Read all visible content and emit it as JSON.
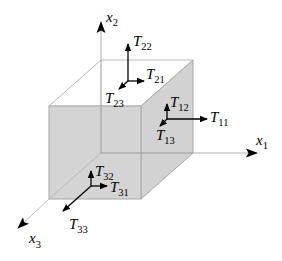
{
  "figure": {
    "colors": {
      "face_fill": "#d4d4d4",
      "edge": "#a8a8a8",
      "axis": "#b0b0b0",
      "arrow": "#000000"
    }
  },
  "axes": [
    {
      "id": "x1",
      "base": "x",
      "sub": "1"
    },
    {
      "id": "x2",
      "base": "x",
      "sub": "2"
    },
    {
      "id": "x3",
      "base": "x",
      "sub": "3"
    }
  ],
  "stress_labels": [
    {
      "id": "T11",
      "base": "T",
      "sub": "11"
    },
    {
      "id": "T12",
      "base": "T",
      "sub": "12"
    },
    {
      "id": "T13",
      "base": "T",
      "sub": "13"
    },
    {
      "id": "T21",
      "base": "T",
      "sub": "21"
    },
    {
      "id": "T22",
      "base": "T",
      "sub": "22"
    },
    {
      "id": "T23",
      "base": "T",
      "sub": "23"
    },
    {
      "id": "T31",
      "base": "T",
      "sub": "31"
    },
    {
      "id": "T32",
      "base": "T",
      "sub": "32"
    },
    {
      "id": "T33",
      "base": "T",
      "sub": "33"
    }
  ]
}
